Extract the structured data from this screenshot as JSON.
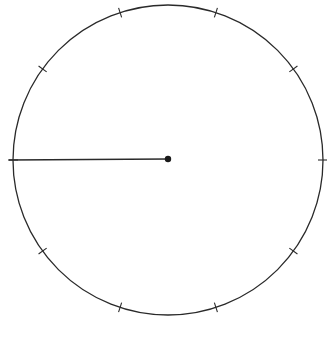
{
  "diagram": {
    "type": "circle-with-ticks-and-radius",
    "circle": {
      "cx": 168,
      "cy": 160,
      "r": 155,
      "stroke": "#2a2a2a",
      "stroke_width": 1.3
    },
    "center_dot": {
      "cx": 168,
      "cy": 159,
      "r": 3.2,
      "fill": "#1a1a1a"
    },
    "radius_line": {
      "x1": 9,
      "y1": 160,
      "x2": 168,
      "y2": 159,
      "stroke": "#2a2a2a",
      "stroke_width": 1.3
    },
    "ticks": {
      "count": 10,
      "start_angle_deg": 18,
      "step_deg": 36,
      "half_length": 5,
      "stroke": "#2a2a2a",
      "stroke_width": 1.1
    }
  }
}
